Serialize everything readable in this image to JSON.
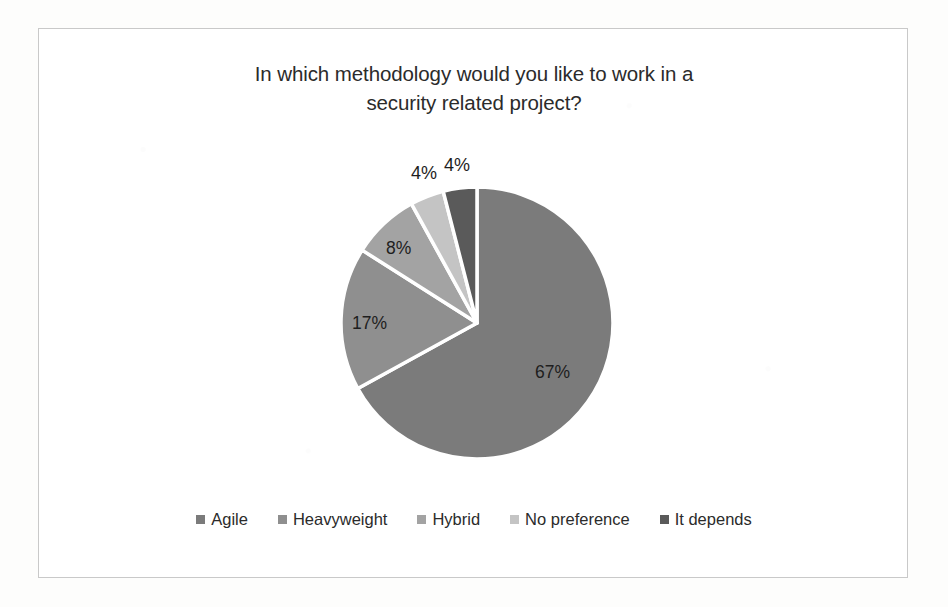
{
  "frame": {
    "border_color": "#c9c9c9",
    "background": "#ffffff"
  },
  "chart_data": {
    "type": "pie",
    "title": "In which methodology would you like to work in a security related project?",
    "title_line1": "In which methodology would you like to work in a",
    "title_line2": "security related project?",
    "categories": [
      "Agile",
      "Heavyweight",
      "Hybrid",
      "No preference",
      "It depends"
    ],
    "values": [
      67,
      17,
      8,
      4,
      4
    ],
    "value_labels": [
      "67%",
      "17%",
      "8%",
      "4%",
      "4%"
    ],
    "unit": "%",
    "colors": [
      "#7b7b7b",
      "#8f8f8f",
      "#a3a3a3",
      "#c4c4c4",
      "#5a5a5a"
    ],
    "slice_border_color": "#ffffff",
    "label_position": [
      "inside",
      "inside",
      "inside",
      "outside",
      "outside"
    ],
    "legend_position": "bottom",
    "grid": false,
    "xlabel": "",
    "ylabel": ""
  },
  "legend": {
    "items": [
      {
        "label": "Agile",
        "color": "#7b7b7b"
      },
      {
        "label": "Heavyweight",
        "color": "#8f8f8f"
      },
      {
        "label": "Hybrid",
        "color": "#a3a3a3"
      },
      {
        "label": "No preference",
        "color": "#c4c4c4"
      },
      {
        "label": "It depends",
        "color": "#5a5a5a"
      }
    ]
  },
  "labels": {
    "agile": "67%",
    "heavyweight": "17%",
    "hybrid": "8%",
    "no_preference": "4%",
    "it_depends": "4%"
  }
}
